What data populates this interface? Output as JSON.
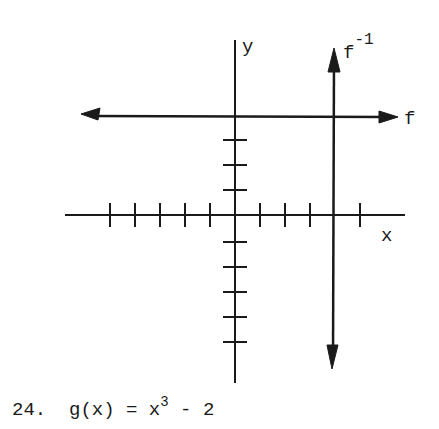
{
  "diagram": {
    "x_axis_label": "x",
    "y_axis_label": "y",
    "line_f_label": "f",
    "line_finv_label_base": "f",
    "line_finv_label_exp": "-1",
    "x_ticks_left": 5,
    "x_ticks_right": 4,
    "y_ticks_up": 4,
    "y_ticks_down": 5,
    "f_description": "horizontal line y = 4 (double-headed arrow)",
    "finv_description": "vertical line x = 4 (double-headed arrow)",
    "f_y_value": 4,
    "finv_x_value": 4,
    "ink_color": "#1a1a1a"
  },
  "problem": {
    "number": "24.",
    "lhs": "g(x)",
    "equals": "=",
    "base": "x",
    "exponent": "3",
    "rest": "- 2"
  }
}
